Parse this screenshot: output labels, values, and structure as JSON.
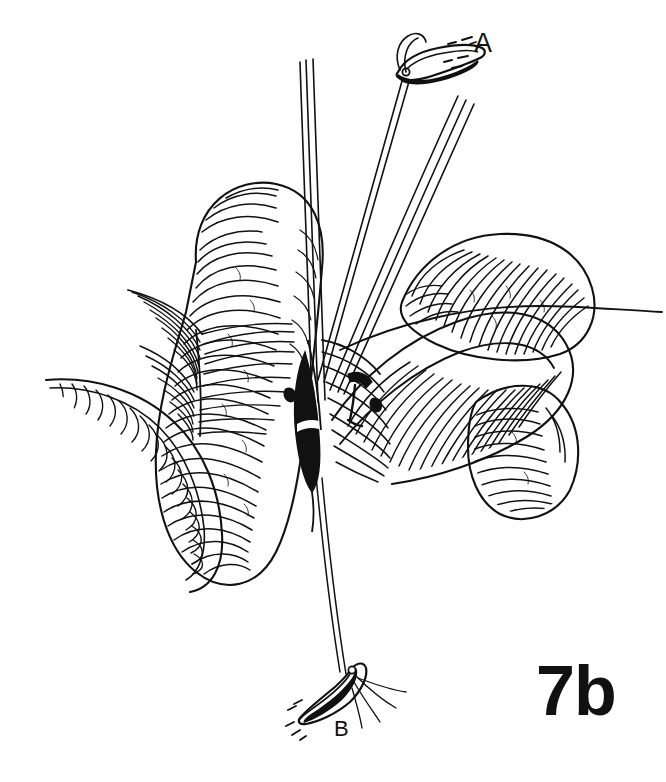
{
  "figure": {
    "number": "7b",
    "domain": "surgical-line-art-illustration",
    "background_color": "#ffffff",
    "ink_color": "#111111",
    "width": 666,
    "height": 782
  },
  "labels": {
    "a": "A",
    "b": "B",
    "figure_number": "7b"
  },
  "annotations": [
    {
      "id": "a",
      "text": "A",
      "x": 487,
      "y": 47,
      "points_to": "upper-hemostat-clamp"
    },
    {
      "id": "b",
      "text": "B",
      "x": 343,
      "y": 733,
      "points_to": "lower-hemostat-clamp"
    },
    {
      "id": "figure_number",
      "text": "7b",
      "x": 596,
      "y": 692,
      "points_to": "figure-caption"
    }
  ],
  "scene": {
    "title": "Bowel loops with enterotomy and traction sutures",
    "elements": [
      "left-bowel-loop",
      "left-bowel-tail",
      "mesentery-fan",
      "right-bowel-loop-upper",
      "right-bowel-loop-lower",
      "enterotomy-incision",
      "instrument-shaft-left",
      "instrument-shaft-center",
      "instrument-shaft-right",
      "suture-thread-upper",
      "suture-thread-lower",
      "suture-thread-right",
      "upper-hemostat-clamp",
      "lower-hemostat-clamp"
    ]
  }
}
